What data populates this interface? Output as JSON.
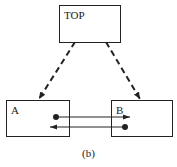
{
  "diagram": {
    "nodes": [
      {
        "id": "top",
        "label": "TOP"
      },
      {
        "id": "a",
        "label": "A"
      },
      {
        "id": "b",
        "label": "B"
      }
    ],
    "edges": [
      {
        "from": "TOP",
        "to": "A",
        "style": "dashed",
        "arrow": "end"
      },
      {
        "from": "TOP",
        "to": "B",
        "style": "dashed",
        "arrow": "end"
      },
      {
        "from": "A",
        "to": "B",
        "style": "solid",
        "arrow": "end",
        "start_marker": "dot"
      },
      {
        "from": "B",
        "to": "A",
        "style": "solid",
        "arrow": "end",
        "start_marker": "dot"
      }
    ],
    "caption": "(b)",
    "colors": {
      "stroke": "#222222",
      "background": "#ffffff"
    }
  }
}
